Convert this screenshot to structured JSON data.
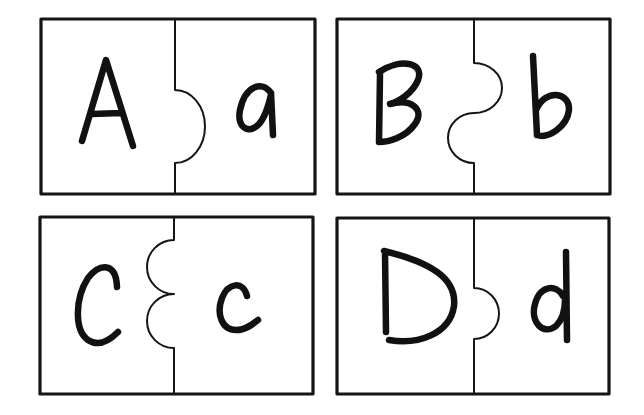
{
  "worksheet": {
    "title": "Alphabet matching puzzle cards",
    "cards": [
      {
        "id": "A",
        "uppercase": "A",
        "lowercase": "a",
        "joint": "single-tab-right"
      },
      {
        "id": "B",
        "uppercase": "B",
        "lowercase": "b",
        "joint": "s-curve"
      },
      {
        "id": "C",
        "uppercase": "C",
        "lowercase": "c",
        "joint": "double-tab-left"
      },
      {
        "id": "D",
        "uppercase": "D",
        "lowercase": "d",
        "joint": "small-tab-right"
      }
    ],
    "colors": {
      "ink": "#151515",
      "paper": "#ffffff"
    }
  }
}
